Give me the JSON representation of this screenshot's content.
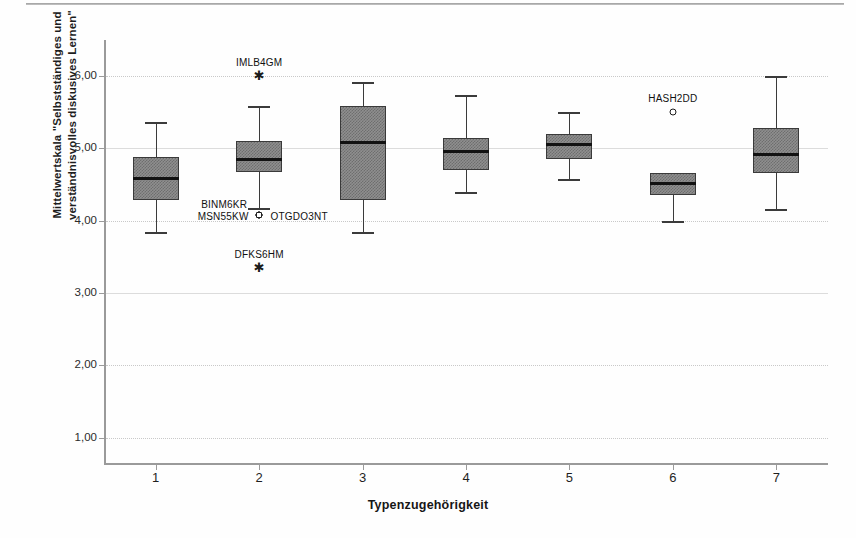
{
  "chart_data": {
    "type": "box",
    "title": "",
    "xlabel": "Typenzugehörigkeit",
    "ylabel_line1": "Mittelwertskala \"Selbstständiges und",
    "ylabel_line2": "verständnisvolles diskusives Lernen\"",
    "ylim": [
      0.62,
      6.5
    ],
    "ytick_labels": [
      "6,00",
      "5,00",
      "4,00",
      "3,00",
      "2,00",
      "1,00"
    ],
    "ytick_values": [
      6.0,
      5.0,
      4.0,
      3.0,
      2.0,
      1.0
    ],
    "xtick_labels": [
      "1",
      "2",
      "3",
      "4",
      "5",
      "6",
      "7"
    ],
    "grid": "horizontal-dotted",
    "legend": "none",
    "categories": [
      "1",
      "2",
      "3",
      "4",
      "5",
      "6",
      "7"
    ],
    "boxes": [
      {
        "category": "1",
        "whisker_low": 3.84,
        "q1": 4.28,
        "median": 4.58,
        "q3": 4.88,
        "whisker_high": 5.36
      },
      {
        "category": "2",
        "whisker_low": 4.18,
        "q1": 4.68,
        "median": 4.84,
        "q3": 5.1,
        "whisker_high": 5.58
      },
      {
        "category": "3",
        "whisker_low": 3.84,
        "q1": 4.28,
        "median": 5.08,
        "q3": 5.58,
        "whisker_high": 5.92
      },
      {
        "category": "4",
        "whisker_low": 4.4,
        "q1": 4.7,
        "median": 4.96,
        "q3": 5.14,
        "whisker_high": 5.74
      },
      {
        "category": "5",
        "whisker_low": 4.58,
        "q1": 4.86,
        "median": 5.06,
        "q3": 5.2,
        "whisker_high": 5.5
      },
      {
        "category": "6",
        "whisker_low": 4.0,
        "q1": 4.36,
        "median": 4.52,
        "q3": 4.66,
        "whisker_high": 4.66
      },
      {
        "category": "7",
        "whisker_low": 4.16,
        "q1": 4.66,
        "median": 4.92,
        "q3": 5.28,
        "whisker_high": 6.0
      }
    ],
    "outliers": [
      {
        "id": "IMLB4GM",
        "category": "2",
        "value": 6.0,
        "marker": "star",
        "label_dx": 0,
        "label_dy": -14
      },
      {
        "id": "BINM6KR",
        "category": "2",
        "value": 4.08,
        "marker": "circle",
        "label_dx": -35,
        "label_dy": -11
      },
      {
        "id": "MSN55KW",
        "category": "2",
        "value": 4.08,
        "marker": "circle",
        "label_dx": -36,
        "label_dy": 1
      },
      {
        "id": "OTGDO3NT",
        "category": "2",
        "value": 4.08,
        "marker": "circle",
        "label_dx": 40,
        "label_dy": 1
      },
      {
        "id": "DFKS6HM",
        "category": "2",
        "value": 3.35,
        "marker": "star",
        "label_dx": 0,
        "label_dy": -14
      },
      {
        "id": "HASH2DD",
        "category": "6",
        "value": 5.5,
        "marker": "circle",
        "label_dx": 0,
        "label_dy": -14
      }
    ]
  }
}
